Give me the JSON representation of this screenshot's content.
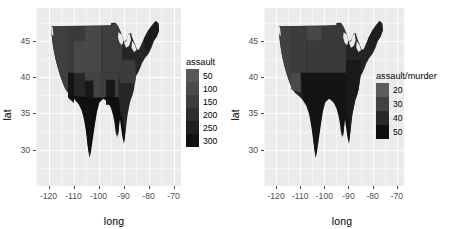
{
  "figure": {
    "background": "#ffffff",
    "panel_background": "#ebebeb",
    "gridline_color": "#ffffff",
    "tick_color": "#4d4d4d",
    "text_color": "#000000"
  },
  "chart_data": [
    {
      "type": "heatmap",
      "subtype": "choropleth-map",
      "title": "",
      "xlabel": "long",
      "ylabel": "lat",
      "xlim": [
        -125,
        -67
      ],
      "ylim": [
        25,
        49.5
      ],
      "xticks": [
        "-120",
        "-110",
        "-100",
        "-90",
        "-80",
        "-70"
      ],
      "xtick_values": [
        -120,
        -110,
        -100,
        -90,
        -80,
        -70
      ],
      "yticks": [
        "45",
        "40",
        "35",
        "30"
      ],
      "ytick_values": [
        45,
        40,
        35,
        30
      ],
      "grid": true,
      "legend": {
        "title": "assault",
        "position": "right",
        "type": "continuous-colorbar",
        "labels": [
          "50",
          "100",
          "150",
          "200",
          "250",
          "300"
        ],
        "values": [
          50,
          100,
          150,
          200,
          250,
          300
        ],
        "low_color": "#595959",
        "high_color": "#111111"
      },
      "series": [
        {
          "name": "Alabama",
          "value": 236
        },
        {
          "name": "Arizona",
          "value": 294
        },
        {
          "name": "Arkansas",
          "value": 190
        },
        {
          "name": "California",
          "value": 276
        },
        {
          "name": "Colorado",
          "value": 204
        },
        {
          "name": "Connecticut",
          "value": 110
        },
        {
          "name": "Delaware",
          "value": 238
        },
        {
          "name": "Florida",
          "value": 335
        },
        {
          "name": "Georgia",
          "value": 211
        },
        {
          "name": "Idaho",
          "value": 120
        },
        {
          "name": "Illinois",
          "value": 249
        },
        {
          "name": "Indiana",
          "value": 113
        },
        {
          "name": "Iowa",
          "value": 56
        },
        {
          "name": "Kansas",
          "value": 115
        },
        {
          "name": "Kentucky",
          "value": 109
        },
        {
          "name": "Louisiana",
          "value": 249
        },
        {
          "name": "Maine",
          "value": 83
        },
        {
          "name": "Maryland",
          "value": 300
        },
        {
          "name": "Massachusetts",
          "value": 149
        },
        {
          "name": "Michigan",
          "value": 255
        },
        {
          "name": "Minnesota",
          "value": 72
        },
        {
          "name": "Mississippi",
          "value": 259
        },
        {
          "name": "Missouri",
          "value": 178
        },
        {
          "name": "Montana",
          "value": 109
        },
        {
          "name": "Nebraska",
          "value": 102
        },
        {
          "name": "Nevada",
          "value": 252
        },
        {
          "name": "New Hampshire",
          "value": 57
        },
        {
          "name": "New Jersey",
          "value": 159
        },
        {
          "name": "New Mexico",
          "value": 285
        },
        {
          "name": "New York",
          "value": 254
        },
        {
          "name": "North Carolina",
          "value": 337
        },
        {
          "name": "North Dakota",
          "value": 45
        },
        {
          "name": "Ohio",
          "value": 120
        },
        {
          "name": "Oklahoma",
          "value": 151
        },
        {
          "name": "Oregon",
          "value": 159
        },
        {
          "name": "Pennsylvania",
          "value": 106
        },
        {
          "name": "Rhode Island",
          "value": 174
        },
        {
          "name": "South Carolina",
          "value": 279
        },
        {
          "name": "South Dakota",
          "value": 86
        },
        {
          "name": "Tennessee",
          "value": 188
        },
        {
          "name": "Texas",
          "value": 201
        },
        {
          "name": "Utah",
          "value": 120
        },
        {
          "name": "Vermont",
          "value": 48
        },
        {
          "name": "Virginia",
          "value": 156
        },
        {
          "name": "Washington",
          "value": 145
        },
        {
          "name": "West Virginia",
          "value": 81
        },
        {
          "name": "Wisconsin",
          "value": 53
        },
        {
          "name": "Wyoming",
          "value": 161
        }
      ]
    },
    {
      "type": "heatmap",
      "subtype": "choropleth-map",
      "title": "",
      "xlabel": "long",
      "ylabel": "lat",
      "xlim": [
        -125,
        -67
      ],
      "ylim": [
        25,
        49.5
      ],
      "xticks": [
        "-120",
        "-110",
        "-100",
        "-90",
        "-80",
        "-70"
      ],
      "xtick_values": [
        -120,
        -110,
        -100,
        -90,
        -80,
        -70
      ],
      "yticks": [
        "45",
        "40",
        "35",
        "30"
      ],
      "ytick_values": [
        45,
        40,
        35,
        30
      ],
      "grid": true,
      "legend": {
        "title": "assault/murder",
        "position": "right",
        "type": "continuous-colorbar",
        "labels": [
          "20",
          "30",
          "40",
          "50"
        ],
        "values": [
          20,
          30,
          40,
          50
        ],
        "low_color": "#5c5c5c",
        "high_color": "#0f0f0f"
      },
      "series": [
        {
          "name": "Alabama",
          "value": 18.1
        },
        {
          "name": "Arizona",
          "value": 33.8
        },
        {
          "name": "Arkansas",
          "value": 21.3
        },
        {
          "name": "California",
          "value": 30.7
        },
        {
          "name": "Colorado",
          "value": 26.2
        },
        {
          "name": "Connecticut",
          "value": 42.3
        },
        {
          "name": "Delaware",
          "value": 39.0
        },
        {
          "name": "Florida",
          "value": 21.6
        },
        {
          "name": "Georgia",
          "value": 12.9
        },
        {
          "name": "Idaho",
          "value": 47.2
        },
        {
          "name": "Illinois",
          "value": 23.1
        },
        {
          "name": "Indiana",
          "value": 16.4
        },
        {
          "name": "Iowa",
          "value": 25.5
        },
        {
          "name": "Kansas",
          "value": 19.2
        },
        {
          "name": "Kentucky",
          "value": 11.8
        },
        {
          "name": "Louisiana",
          "value": 16.1
        },
        {
          "name": "Maine",
          "value": 39.5
        },
        {
          "name": "Maryland",
          "value": 27.3
        },
        {
          "name": "Massachusetts",
          "value": 34.7
        },
        {
          "name": "Michigan",
          "value": 21.3
        },
        {
          "name": "Minnesota",
          "value": 27.7
        },
        {
          "name": "Mississippi",
          "value": 15.9
        },
        {
          "name": "Missouri",
          "value": 18.3
        },
        {
          "name": "Montana",
          "value": 18.2
        },
        {
          "name": "Nebraska",
          "value": 23.2
        },
        {
          "name": "Nevada",
          "value": 20.5
        },
        {
          "name": "New Hampshire",
          "value": 26.0
        },
        {
          "name": "New Jersey",
          "value": 22.1
        },
        {
          "name": "New Mexico",
          "value": 25.7
        },
        {
          "name": "New York",
          "value": 23.3
        },
        {
          "name": "North Carolina",
          "value": 26.7
        },
        {
          "name": "North Dakota",
          "value": 35.6
        },
        {
          "name": "Ohio",
          "value": 17.1
        },
        {
          "name": "Oklahoma",
          "value": 24.4
        },
        {
          "name": "Oregon",
          "value": 33.3
        },
        {
          "name": "Pennsylvania",
          "value": 16.3
        },
        {
          "name": "Rhode Island",
          "value": 47.6
        },
        {
          "name": "South Carolina",
          "value": 19.1
        },
        {
          "name": "South Dakota",
          "value": 22.6
        },
        {
          "name": "Tennessee",
          "value": 14.6
        },
        {
          "name": "Texas",
          "value": 15.7
        },
        {
          "name": "Utah",
          "value": 40.0
        },
        {
          "name": "Vermont",
          "value": 20.0
        },
        {
          "name": "Virginia",
          "value": 20.8
        },
        {
          "name": "Washington",
          "value": 36.3
        },
        {
          "name": "West Virginia",
          "value": 13.9
        },
        {
          "name": "Wisconsin",
          "value": 20.4
        },
        {
          "name": "Wyoming",
          "value": 24.8
        }
      ]
    }
  ],
  "left_plot": {
    "axis_x_title": "long",
    "axis_y_title": "lat",
    "xticks": [
      {
        "label": "-120"
      },
      {
        "label": "-110"
      },
      {
        "label": "-100"
      },
      {
        "label": "-90"
      },
      {
        "label": "-80"
      },
      {
        "label": "-70"
      }
    ],
    "yticks": [
      {
        "label": "45"
      },
      {
        "label": "40"
      },
      {
        "label": "35"
      },
      {
        "label": "30"
      }
    ],
    "legend": {
      "title": "assault",
      "keys": [
        {
          "label": "50"
        },
        {
          "label": "100"
        },
        {
          "label": "150"
        },
        {
          "label": "200"
        },
        {
          "label": "250"
        },
        {
          "label": "300"
        }
      ]
    }
  },
  "right_plot": {
    "axis_x_title": "long",
    "axis_y_title": "lat",
    "xticks": [
      {
        "label": "-120"
      },
      {
        "label": "-110"
      },
      {
        "label": "-100"
      },
      {
        "label": "-90"
      },
      {
        "label": "-80"
      },
      {
        "label": "-70"
      }
    ],
    "yticks": [
      {
        "label": "45"
      },
      {
        "label": "40"
      },
      {
        "label": "35"
      },
      {
        "label": "30"
      }
    ],
    "legend": {
      "title": "assault/murder",
      "keys": [
        {
          "label": "20"
        },
        {
          "label": "30"
        },
        {
          "label": "40"
        },
        {
          "label": "50"
        }
      ]
    }
  }
}
